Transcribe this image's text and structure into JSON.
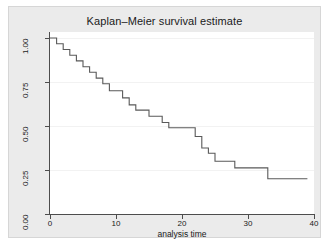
{
  "chart_data": {
    "type": "line",
    "subtype": "step-post",
    "title": "Kaplan–Meier survival estimate",
    "xlabel": "analysis time",
    "ylabel": "",
    "xlim": [
      0,
      40
    ],
    "ylim": [
      0,
      1
    ],
    "grid": true,
    "legend": null,
    "xticks": [
      0,
      10,
      20,
      30,
      40
    ],
    "xticklabels": [
      "0",
      "10",
      "20",
      "30",
      "40"
    ],
    "yticks": [
      0.0,
      0.25,
      0.5,
      0.75,
      1.0
    ],
    "yticklabels": [
      "0.00",
      "0.25",
      "0.50",
      "0.75",
      "1.00"
    ],
    "series": [
      {
        "name": "survivor function",
        "color": "#595959",
        "x": [
          0,
          1,
          2,
          3,
          4,
          5,
          6,
          7,
          8,
          9,
          10,
          11,
          12,
          13,
          14,
          15,
          16,
          17,
          22,
          23,
          24,
          25,
          26,
          28,
          33,
          39
        ],
        "y": [
          1.0,
          1.0,
          0.96,
          0.93,
          0.89,
          0.85,
          0.82,
          0.78,
          0.74,
          0.7,
          0.66,
          0.63,
          0.63,
          0.59,
          0.56,
          0.56,
          0.52,
          0.49,
          0.49,
          0.44,
          0.37,
          0.35,
          0.3,
          0.26,
          0.26,
          0.2
        ]
      }
    ],
    "steps": [
      {
        "t": 0,
        "s": 1.0
      },
      {
        "t": 1,
        "s": 1.0
      },
      {
        "t": 1,
        "s": 0.967
      },
      {
        "t": 2,
        "s": 0.967
      },
      {
        "t": 2,
        "s": 0.935
      },
      {
        "t": 3,
        "s": 0.935
      },
      {
        "t": 3,
        "s": 0.902
      },
      {
        "t": 4,
        "s": 0.902
      },
      {
        "t": 4,
        "s": 0.87
      },
      {
        "t": 5,
        "s": 0.87
      },
      {
        "t": 5,
        "s": 0.837
      },
      {
        "t": 6,
        "s": 0.837
      },
      {
        "t": 6,
        "s": 0.805
      },
      {
        "t": 7,
        "s": 0.805
      },
      {
        "t": 7,
        "s": 0.772
      },
      {
        "t": 8,
        "s": 0.772
      },
      {
        "t": 8,
        "s": 0.74
      },
      {
        "t": 9,
        "s": 0.74
      },
      {
        "t": 9,
        "s": 0.7
      },
      {
        "t": 11,
        "s": 0.7
      },
      {
        "t": 11,
        "s": 0.66
      },
      {
        "t": 12,
        "s": 0.66
      },
      {
        "t": 12,
        "s": 0.62
      },
      {
        "t": 13,
        "s": 0.62
      },
      {
        "t": 13,
        "s": 0.59
      },
      {
        "t": 15,
        "s": 0.59
      },
      {
        "t": 15,
        "s": 0.555
      },
      {
        "t": 17,
        "s": 0.555
      },
      {
        "t": 17,
        "s": 0.52
      },
      {
        "t": 18,
        "s": 0.52
      },
      {
        "t": 18,
        "s": 0.49
      },
      {
        "t": 22,
        "s": 0.49
      },
      {
        "t": 22,
        "s": 0.44
      },
      {
        "t": 23,
        "s": 0.44
      },
      {
        "t": 23,
        "s": 0.375
      },
      {
        "t": 24,
        "s": 0.375
      },
      {
        "t": 24,
        "s": 0.345
      },
      {
        "t": 25,
        "s": 0.345
      },
      {
        "t": 25,
        "s": 0.3
      },
      {
        "t": 28,
        "s": 0.3
      },
      {
        "t": 28,
        "s": 0.262
      },
      {
        "t": 33,
        "s": 0.262
      },
      {
        "t": 33,
        "s": 0.2
      },
      {
        "t": 39,
        "s": 0.2
      }
    ]
  },
  "axes": {
    "x_title": "analysis time",
    "x_labels": [
      "0",
      "10",
      "20",
      "30",
      "40"
    ],
    "y_labels": [
      "0.00",
      "0.25",
      "0.50",
      "0.75",
      "1.00"
    ]
  },
  "title": "Kaplan–Meier survival estimate",
  "colors": {
    "graph_background": "#ebebeb",
    "plot_background": "#ffffff",
    "line": "#595959",
    "axis": "#4d4d4d",
    "grid": "#f2f2f2",
    "text": "#1a1a1a"
  }
}
